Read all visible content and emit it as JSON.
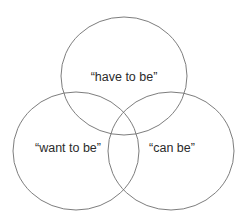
{
  "diagram": {
    "type": "venn",
    "sets": [
      {
        "id": "have",
        "label": "“have to be”",
        "cx": 124,
        "cy": 76,
        "rx": 63,
        "ry": 59,
        "label_x": 124,
        "label_y": 81
      },
      {
        "id": "want",
        "label": "“want to be”",
        "cx": 76,
        "cy": 151,
        "rx": 63,
        "ry": 59,
        "label_x": 68,
        "label_y": 152
      },
      {
        "id": "can",
        "label": "“can be”",
        "cx": 171,
        "cy": 151,
        "rx": 63,
        "ry": 59,
        "label_x": 172,
        "label_y": 152
      }
    ],
    "stroke_color": "#6e6e6e",
    "text_color": "#2b2b2b",
    "background": "#ffffff"
  }
}
